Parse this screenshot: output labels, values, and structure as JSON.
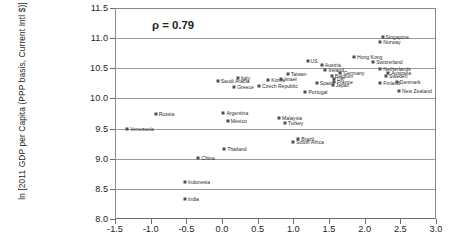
{
  "chart": {
    "type": "scatter",
    "annotation": "ρ = 0.79",
    "ylabel": "ln [2011 GDP per Capita (PPP basis, Current Intl $)]",
    "xlabel": ""
  },
  "axes": {
    "y_ticks": [
      "8.0",
      "8.5",
      "9.0",
      "9.5",
      "10.0",
      "10.5",
      "11.0",
      "11.5"
    ],
    "x_ticks": [
      "-1.5",
      "-1.0",
      "-0.5",
      "0.0",
      "0.5",
      "1.0",
      "1.5",
      "2.0",
      "2.5",
      "3.0"
    ]
  },
  "chart_data": {
    "type": "scatter",
    "title": "",
    "xlabel": "",
    "ylabel": "ln [2011 GDP per Capita (PPP basis, Current Intl $)]",
    "xlim": [
      -1.5,
      3.0
    ],
    "ylim": [
      8.0,
      11.5
    ],
    "xticks": [
      -1.5,
      -1.0,
      -0.5,
      0.0,
      0.5,
      1.0,
      1.5,
      2.0,
      2.5,
      3.0
    ],
    "yticks": [
      8.0,
      8.5,
      9.0,
      9.5,
      10.0,
      10.5,
      11.0,
      11.5
    ],
    "grid": "horizontal",
    "legend": "none",
    "annotations": [
      "ρ = 0.79"
    ],
    "correlation": 0.79,
    "points": [
      {
        "label": "India",
        "x": -0.52,
        "y": 8.33,
        "label_pos": "right"
      },
      {
        "label": "Indonesia",
        "x": -0.52,
        "y": 8.62,
        "label_pos": "right"
      },
      {
        "label": "China",
        "x": -0.33,
        "y": 9.02,
        "label_pos": "right"
      },
      {
        "label": "Thailand",
        "x": 0.03,
        "y": 9.16,
        "label_pos": "right"
      },
      {
        "label": "South Africa",
        "x": 1.0,
        "y": 9.27,
        "label_pos": "right"
      },
      {
        "label": "Brazil",
        "x": 1.07,
        "y": 9.33,
        "label_pos": "right"
      },
      {
        "label": "Venezuela",
        "x": -1.33,
        "y": 9.49,
        "label_pos": "right"
      },
      {
        "label": "Turkey",
        "x": 0.88,
        "y": 9.59,
        "label_pos": "right"
      },
      {
        "label": "Mexico",
        "x": 0.08,
        "y": 9.62,
        "label_pos": "right"
      },
      {
        "label": "Malaysia",
        "x": 0.8,
        "y": 9.67,
        "label_pos": "right"
      },
      {
        "label": "Russia",
        "x": -0.93,
        "y": 9.74,
        "label_pos": "right"
      },
      {
        "label": "Argentina",
        "x": 0.02,
        "y": 9.76,
        "label_pos": "right"
      },
      {
        "label": "Greece",
        "x": 0.17,
        "y": 10.19,
        "label_pos": "right"
      },
      {
        "label": "Czech Republic",
        "x": 0.52,
        "y": 10.21,
        "label_pos": "right"
      },
      {
        "label": "Portugal",
        "x": 1.17,
        "y": 10.1,
        "label_pos": "right"
      },
      {
        "label": "Saudi Arabia",
        "x": -0.06,
        "y": 10.29,
        "label_pos": "right"
      },
      {
        "label": "Italy",
        "x": 0.22,
        "y": 10.34,
        "label_pos": "right"
      },
      {
        "label": "Korea",
        "x": 0.65,
        "y": 10.31,
        "label_pos": "right"
      },
      {
        "label": "Israel",
        "x": 0.83,
        "y": 10.32,
        "label_pos": "right"
      },
      {
        "label": "Spain",
        "x": 1.33,
        "y": 10.25,
        "label_pos": "right"
      },
      {
        "label": "Taiwan",
        "x": 0.92,
        "y": 10.4,
        "label_pos": "right"
      },
      {
        "label": "Japan",
        "x": 1.55,
        "y": 10.22,
        "label_pos": "right"
      },
      {
        "label": "France",
        "x": 1.57,
        "y": 10.27,
        "label_pos": "right"
      },
      {
        "label": "UK",
        "x": 1.57,
        "y": 10.32,
        "label_pos": "right"
      },
      {
        "label": "Belgium",
        "x": 1.54,
        "y": 10.38,
        "label_pos": "right"
      },
      {
        "label": "Germany",
        "x": 1.66,
        "y": 10.42,
        "label_pos": "right"
      },
      {
        "label": "Ireland",
        "x": 1.45,
        "y": 10.47,
        "label_pos": "right"
      },
      {
        "label": "Austria",
        "x": 1.4,
        "y": 10.56,
        "label_pos": "right"
      },
      {
        "label": "US",
        "x": 1.2,
        "y": 10.62,
        "label_pos": "right"
      },
      {
        "label": "Hong Kong",
        "x": 1.85,
        "y": 10.68,
        "label_pos": "right"
      },
      {
        "label": "Switzerland",
        "x": 2.12,
        "y": 10.6,
        "label_pos": "right"
      },
      {
        "label": "Netherlands",
        "x": 2.22,
        "y": 10.48,
        "label_pos": "right"
      },
      {
        "label": "Australia",
        "x": 2.33,
        "y": 10.43,
        "label_pos": "right"
      },
      {
        "label": "Sweden",
        "x": 2.3,
        "y": 10.37,
        "label_pos": "right"
      },
      {
        "label": "Finland",
        "x": 2.22,
        "y": 10.25,
        "label_pos": "right"
      },
      {
        "label": "Denmark",
        "x": 2.45,
        "y": 10.28,
        "label_pos": "right"
      },
      {
        "label": "New Zealand",
        "x": 2.48,
        "y": 10.12,
        "label_pos": "right"
      },
      {
        "label": "Norway",
        "x": 2.22,
        "y": 10.93,
        "label_pos": "right"
      },
      {
        "label": "Singapore",
        "x": 2.25,
        "y": 11.02,
        "label_pos": "right"
      }
    ]
  }
}
